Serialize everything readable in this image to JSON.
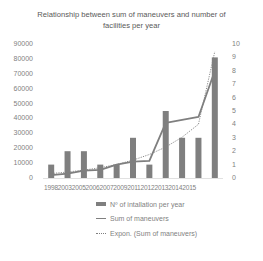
{
  "chart_data": {
    "type": "bar",
    "title": "Relationship between sum of maneuvers and number of facilities per year",
    "title_lines": [
      "Relationship between sum of maneuvers and number of",
      "facilities per year"
    ],
    "categories": [
      "1998",
      "2003",
      "2005",
      "2006",
      "2007",
      "2009",
      "2011",
      "2012",
      "2013",
      "2014",
      "2015"
    ],
    "series": [
      {
        "name": "Nº of intallation per year",
        "type": "bar",
        "axis": "right",
        "values": [
          1,
          2,
          2,
          1,
          1,
          3,
          1,
          5,
          3,
          3,
          9
        ]
      },
      {
        "name": "Sum of maneuvers",
        "type": "line",
        "axis": "left",
        "values": [
          2000,
          3000,
          5000,
          5500,
          9000,
          11000,
          11500,
          37000,
          39000,
          41000,
          72000
        ]
      },
      {
        "name": "Expon. (Sum of maneuvers)",
        "type": "line-dotted",
        "axis": "left",
        "values": [
          3000,
          4000,
          5300,
          6900,
          9100,
          12000,
          15800,
          20800,
          27400,
          36100,
          85000
        ]
      }
    ],
    "left_axis": {
      "ylim": [
        0,
        90000
      ],
      "ticks": [
        "90000",
        "80000",
        "70000",
        "60000",
        "50000",
        "40000",
        "30000",
        "20000",
        "10000",
        "0"
      ]
    },
    "right_axis": {
      "ylim": [
        0,
        10
      ],
      "ticks": [
        "10",
        "9",
        "8",
        "7",
        "6",
        "5",
        "4",
        "3",
        "2",
        "1",
        "0"
      ]
    },
    "xlabel": "",
    "ylabel": "",
    "grid": false,
    "legend_position": "bottom",
    "colors": {
      "bar": "#7f7f7f",
      "line": "#7f7f7f",
      "trend": "#7f7f7f"
    }
  },
  "labels": {
    "title_line1": "Relationship between sum of maneuvers and number of",
    "title_line2": "facilities per year",
    "x_axis_text": "19982003200520062007200920112012201320142015",
    "legend": {
      "bars": "Nº of intallation per year",
      "line": "Sum of maneuvers",
      "trend": "Expon. (Sum of maneuvers)"
    }
  }
}
